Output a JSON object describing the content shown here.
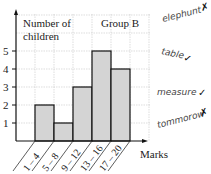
{
  "chart_data": {
    "type": "bar",
    "title": "Group B",
    "xlabel": "Marks",
    "ylabel": "Number of children",
    "categories": [
      "1 – 4",
      "5 – 8",
      "9 – 12",
      "13 – 16",
      "17 – 20"
    ],
    "values": [
      2,
      1,
      3,
      5,
      4
    ],
    "ylim": [
      0,
      7
    ],
    "yticks": [
      1,
      2,
      3,
      4,
      5
    ],
    "grid": true,
    "bar_color": "#d4d4d4",
    "legend": null
  },
  "labels": {
    "ylabel_line1": "Number of",
    "ylabel_line2": "children",
    "group": "Group B",
    "xlabel": "Marks"
  },
  "annotations": [
    {
      "word": "elephunt",
      "mark": "✗"
    },
    {
      "word": "table",
      "mark": "✓"
    },
    {
      "word": "measure",
      "mark": "✓"
    },
    {
      "word": "tommorow",
      "mark": "✗"
    }
  ]
}
